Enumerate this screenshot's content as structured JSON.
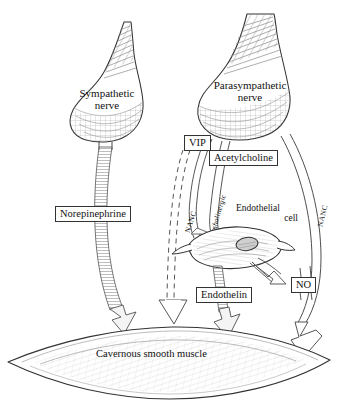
{
  "figure": {
    "style": "hand-drawn line illustration, black ink on white"
  },
  "nerves": {
    "sympathetic": {
      "label_line1": "Sympathetic",
      "label_line2": "nerve"
    },
    "parasympathetic": {
      "label_line1": "Parasympathetic",
      "label_line2": "nerve"
    }
  },
  "mediators": {
    "norepinephrine": "Norepinephrine",
    "vip": "VIP",
    "acetylcholine": "Acetylcholine",
    "endothelin": "Endothelin",
    "nitric_oxide": "NO"
  },
  "fiber_labels": {
    "nanc_left": "NANC",
    "cholinergic": "cholinergic",
    "nanc_right": "NANC"
  },
  "cells": {
    "endothelial": {
      "label_line1": "Endothelial",
      "label_line2": "cell"
    }
  },
  "target": {
    "smooth_muscle": "Cavernous smooth muscle"
  },
  "colors": {
    "ink": "#1a1a1a",
    "stroke": "#333333",
    "hatch": "#8a8a8a",
    "fill_light": "#f2f2f2",
    "page": "#ffffff"
  }
}
